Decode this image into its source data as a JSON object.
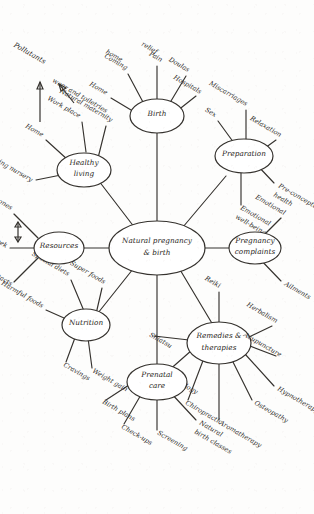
{
  "diagram": {
    "type": "mind-map",
    "title": "Natural pregnancy & birth",
    "style": "hand-drawn ink sketch on paper, rotated 90 degrees",
    "ink_color": "#35322e",
    "paper_color": "#fdfdfc",
    "center": {
      "id": "center",
      "label": "Natural pregnancy\n& birth",
      "line1": "Natural pregnancy",
      "line2": "& birth"
    },
    "branches": [
      {
        "id": "preparation",
        "label": "Preparation",
        "line1": "Preparation",
        "line2": "",
        "leaves": [
          {
            "label": "Relaxation"
          },
          {
            "label": "Pre-conceptual health",
            "line1": "Pre-conceptual",
            "line2": "health"
          },
          {
            "label": "Emotional well-being",
            "line1": "Emotional",
            "line2": "well-being"
          },
          {
            "label": "Miscarriages"
          },
          {
            "label": "Sex"
          }
        ]
      },
      {
        "id": "pregnancy-complaints",
        "label": "Pregnancy complaints",
        "line1": "Pregnancy",
        "line2": "complaints",
        "leaves": [
          {
            "label": "Emotional"
          },
          {
            "label": "Ailments"
          }
        ]
      },
      {
        "id": "remedies-therapies",
        "label": "Remedies & therapies",
        "line1": "Remedies &",
        "line2": "therapies",
        "leaves": [
          {
            "label": "Herbalism"
          },
          {
            "label": "Acupuncture"
          },
          {
            "label": "Hypnotherapy"
          },
          {
            "label": "Osteopathy"
          },
          {
            "label": "Aromatherapy"
          },
          {
            "label": "Chiropractic"
          },
          {
            "label": "Reflexology"
          },
          {
            "label": "Shiatsu"
          },
          {
            "label": "Reiki"
          }
        ]
      },
      {
        "id": "prenatal-care",
        "label": "Prenatal care",
        "line1": "Prenatal",
        "line2": "care",
        "leaves": [
          {
            "label": "Natural birth classes",
            "line1": "Natural",
            "line2": "birth classes"
          },
          {
            "label": "Screening"
          },
          {
            "label": "Check-ups"
          },
          {
            "label": "Birth plans"
          }
        ]
      },
      {
        "id": "nutrition",
        "label": "Nutrition",
        "line1": "Nutrition",
        "line2": "",
        "leaves": [
          {
            "label": "Super foods"
          },
          {
            "label": "Special diets"
          },
          {
            "label": "Harmful foods"
          },
          {
            "label": "Cravings"
          },
          {
            "label": "Weight gain"
          }
        ]
      },
      {
        "id": "resources",
        "label": "Resources",
        "line1": "Resources",
        "line2": "",
        "leaves": [
          {
            "label": "Milestones"
          },
          {
            "label": "Week by week"
          },
          {
            "label": "Useful contacts"
          }
        ],
        "annotation": "double-headed arrow between Milestones and Week by week"
      },
      {
        "id": "healthy-living",
        "label": "Healthy living",
        "line1": "Healthy",
        "line2": "living",
        "leaves": [
          {
            "label": "Natural maternity wear and toiletries",
            "line1": "Natural maternity",
            "line2": "wear and toiletries"
          },
          {
            "label": "Work place"
          },
          {
            "label": "Home"
          },
          {
            "label": "Preparing nursery"
          }
        ],
        "annotation": "arrows from Work place and Home point to Pollutants"
      },
      {
        "id": "birth",
        "label": "Birth",
        "line1": "Birth",
        "line2": "",
        "leaves": [
          {
            "label": "Hospitals"
          },
          {
            "label": "Doulas"
          },
          {
            "label": "Pain relief",
            "line1": "Pain",
            "line2": "relief"
          },
          {
            "label": "Coming home",
            "line1": "Coming",
            "line2": "home"
          },
          {
            "label": "Home"
          }
        ]
      }
    ],
    "free_labels": [
      {
        "id": "pollutants",
        "label": "Pollutants"
      }
    ]
  }
}
